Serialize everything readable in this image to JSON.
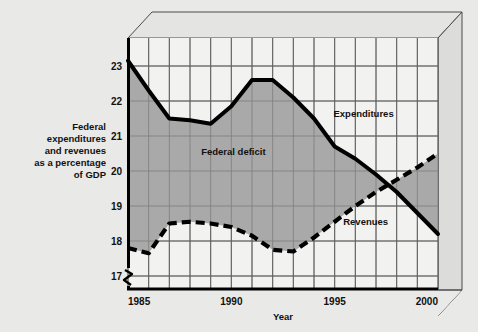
{
  "chart_data": {
    "type": "line",
    "title": "",
    "xlabel": "Year",
    "ylabel": "Federal expenditures and revenues as a percentage of GDP",
    "ylabel_lines": [
      "Federal",
      "expenditures",
      "and revenues",
      "as a percentage",
      "of GDP"
    ],
    "xlim": [
      1985,
      2000
    ],
    "ylim": [
      16.6,
      23.8
    ],
    "y_axis_break": true,
    "grid": true,
    "grid_x_step": 1,
    "grid_y_step": 1,
    "x": [
      1985,
      1986,
      1987,
      1988,
      1989,
      1990,
      1991,
      1992,
      1993,
      1994,
      1995,
      1996,
      1997,
      1998,
      1999,
      2000
    ],
    "xticks": [
      1985,
      1990,
      1995,
      2000
    ],
    "xtick_labels": [
      "1985",
      "1990",
      "1995",
      "2000"
    ],
    "yticks": [
      17,
      18,
      19,
      20,
      21,
      22,
      23
    ],
    "ytick_labels": [
      "17",
      "18",
      "19",
      "20",
      "21",
      "22",
      "23"
    ],
    "series": [
      {
        "name": "Expenditures",
        "style": "solid",
        "color": "#000000",
        "values": [
          23.15,
          22.3,
          21.5,
          21.45,
          21.35,
          21.85,
          22.6,
          22.6,
          22.1,
          21.5,
          20.7,
          20.35,
          19.9,
          19.4,
          18.8,
          18.2
        ]
      },
      {
        "name": "Revenues",
        "style": "dashed",
        "color": "#000000",
        "values": [
          17.8,
          17.65,
          18.5,
          18.55,
          18.5,
          18.4,
          18.15,
          17.75,
          17.7,
          18.1,
          18.55,
          19.0,
          19.4,
          19.75,
          20.1,
          20.5
        ]
      }
    ],
    "annotations": [
      {
        "name": "federal-deficit",
        "text": "Federal deficit",
        "x": 1990.1,
        "y": 20.45
      },
      {
        "name": "expenditures",
        "text": "Expenditures",
        "x": 1996.4,
        "y": 21.55
      },
      {
        "name": "revenues",
        "text": "Revenues",
        "x": 1996.5,
        "y": 18.45
      }
    ],
    "shaded_region": {
      "label": "Federal deficit",
      "between": [
        "Expenditures",
        "Revenues"
      ],
      "color": "#a9a9a9"
    },
    "colors": {
      "page_background": "#e9e9e7",
      "plot_background": "#f2f2f0",
      "shaded_band": "#a9a9a9",
      "grid_line": "#3a3a3a",
      "axis_line": "#000000",
      "text": "#111111",
      "panel_top_face": "#e4e4e2",
      "panel_side_face": "#dcdcda"
    }
  }
}
